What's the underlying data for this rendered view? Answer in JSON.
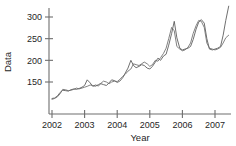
{
  "chart_data": {
    "type": "line",
    "title": "",
    "xlabel": "Year",
    "ylabel": "Data",
    "xlim": [
      2002.0,
      2007.45
    ],
    "ylim": [
      105,
      330
    ],
    "grid": false,
    "legend": false,
    "xticks": [
      2002,
      2003,
      2004,
      2005,
      2006,
      2007
    ],
    "xticklabels": [
      "2002",
      "2003",
      "2004",
      "2005",
      "2006",
      "2007"
    ],
    "yticks": [
      150,
      200,
      250,
      300
    ],
    "yticklabels": [
      "150",
      "200",
      "250",
      "300"
    ],
    "colors": {
      "series_1": "#555555",
      "series_2": "#6b6b6b",
      "axis": "#6e6e6e",
      "text": "#1f1f1f",
      "background": "#ffffff"
    },
    "series": [
      {
        "name": "series_1",
        "color": "#555555",
        "x": [
          2002.0,
          2002.08,
          2002.17,
          2002.25,
          2002.33,
          2002.42,
          2002.5,
          2002.58,
          2002.67,
          2002.75,
          2002.83,
          2002.92,
          2003.0,
          2003.08,
          2003.17,
          2003.25,
          2003.33,
          2003.42,
          2003.5,
          2003.58,
          2003.67,
          2003.75,
          2003.83,
          2003.92,
          2004.0,
          2004.08,
          2004.17,
          2004.25,
          2004.33,
          2004.42,
          2004.5,
          2004.58,
          2004.67,
          2004.75,
          2004.83,
          2004.92,
          2005.0,
          2005.08,
          2005.17,
          2005.25,
          2005.33,
          2005.42,
          2005.5,
          2005.58,
          2005.67,
          2005.75,
          2005.83,
          2005.92,
          2006.0,
          2006.08,
          2006.17,
          2006.25,
          2006.33,
          2006.42,
          2006.5,
          2006.58,
          2006.67,
          2006.75,
          2006.83,
          2006.92,
          2007.0,
          2007.08,
          2007.17,
          2007.25,
          2007.33,
          2007.42
        ],
        "y": [
          112,
          113,
          118,
          126,
          131,
          130,
          129,
          132,
          134,
          133,
          135,
          138,
          142,
          155,
          148,
          140,
          143,
          141,
          146,
          144,
          142,
          148,
          155,
          153,
          149,
          152,
          160,
          171,
          182,
          200,
          188,
          183,
          186,
          190,
          188,
          182,
          180,
          186,
          196,
          205,
          200,
          210,
          214,
          235,
          262,
          290,
          252,
          228,
          224,
          226,
          228,
          232,
          248,
          272,
          288,
          294,
          286,
          250,
          226,
          224,
          226,
          228,
          232,
          258,
          292,
          325
        ]
      },
      {
        "name": "series_2",
        "color": "#6b6b6b",
        "x": [
          2002.0,
          2002.08,
          2002.17,
          2002.25,
          2002.33,
          2002.42,
          2002.5,
          2002.58,
          2002.67,
          2002.75,
          2002.83,
          2002.92,
          2003.0,
          2003.08,
          2003.17,
          2003.25,
          2003.33,
          2003.42,
          2003.5,
          2003.58,
          2003.67,
          2003.75,
          2003.83,
          2003.92,
          2004.0,
          2004.08,
          2004.17,
          2004.25,
          2004.33,
          2004.42,
          2004.5,
          2004.58,
          2004.67,
          2004.75,
          2004.83,
          2004.92,
          2005.0,
          2005.08,
          2005.17,
          2005.25,
          2005.33,
          2005.42,
          2005.5,
          2005.58,
          2005.67,
          2005.75,
          2005.83,
          2005.92,
          2006.0,
          2006.08,
          2006.17,
          2006.25,
          2006.33,
          2006.42,
          2006.5,
          2006.58,
          2006.67,
          2006.75,
          2006.83,
          2006.92,
          2007.0,
          2007.08,
          2007.17,
          2007.25,
          2007.33,
          2007.42
        ],
        "y": [
          110,
          112,
          116,
          123,
          133,
          132,
          130,
          131,
          133,
          136,
          134,
          136,
          138,
          140,
          143,
          142,
          140,
          144,
          147,
          152,
          150,
          146,
          150,
          152,
          151,
          156,
          163,
          168,
          175,
          180,
          192,
          190,
          188,
          192,
          196,
          192,
          186,
          190,
          200,
          198,
          206,
          216,
          228,
          250,
          276,
          268,
          232,
          226,
          222,
          224,
          230,
          240,
          262,
          280,
          292,
          290,
          276,
          240,
          228,
          226,
          224,
          226,
          230,
          240,
          252,
          258
        ]
      }
    ]
  }
}
